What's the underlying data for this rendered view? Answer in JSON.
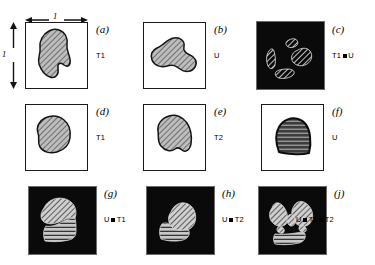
{
  "figure": {
    "dimensions": {
      "width_label": "1",
      "height_label": "1"
    },
    "operator_symbol": "▪",
    "colors": {
      "frame": "#1a1a1a",
      "panel_background": "#ffffff",
      "dark_background": "#0a0a0a",
      "shape_fill": "#b9b9b9",
      "shape_outline": "#111111",
      "hatch_line": "#2b2b2b",
      "white_hatch": "#f2f2f2",
      "dark_stripe_fill": "#3a3a3a"
    },
    "panels": [
      {
        "tag": "(a)",
        "label": "T1",
        "label_parts": [
          "T1"
        ],
        "background": "light",
        "texture": "gray-hatch",
        "description": "irregular gray hatched blob"
      },
      {
        "tag": "(b)",
        "label": "U",
        "label_parts": [
          "U"
        ],
        "background": "light",
        "texture": "gray-hatch",
        "description": "wide wavy gray hatched blob"
      },
      {
        "tag": "(c)",
        "label": "T1▪U",
        "label_parts": [
          "T1",
          "U"
        ],
        "background": "dark",
        "texture": "white-hatch",
        "description": "four separated hatched fragments on black"
      },
      {
        "tag": "(d)",
        "label": "T1",
        "label_parts": [
          "T1"
        ],
        "background": "light",
        "texture": "gray-hatch",
        "description": "rounded gray hatched blob"
      },
      {
        "tag": "(e)",
        "label": "T2",
        "label_parts": [
          "T2"
        ],
        "background": "light",
        "texture": "gray-hatch",
        "description": "rounded gray hatched blob with notch"
      },
      {
        "tag": "(f)",
        "label": "U",
        "label_parts": [
          "U"
        ],
        "background": "light",
        "texture": "dark-stripe",
        "description": "dark dome shape with horizontal stripes"
      },
      {
        "tag": "(g)",
        "label": "U▪T1",
        "label_parts": [
          "U",
          "T1"
        ],
        "background": "dark",
        "texture": "mixed",
        "description": "hatched lobe above, striped region below, on black"
      },
      {
        "tag": "(h)",
        "label": "U▪T2",
        "label_parts": [
          "U",
          "T2"
        ],
        "background": "dark",
        "texture": "mixed",
        "description": "hatched lobe upper right, striped region lower left, on black"
      },
      {
        "tag": "(j)",
        "label": "U▪T1▪T2",
        "label_parts": [
          "U",
          "T1",
          "T2"
        ],
        "background": "dark",
        "texture": "mixed",
        "description": "two hatched lobes above, striped band below, on black"
      }
    ]
  }
}
